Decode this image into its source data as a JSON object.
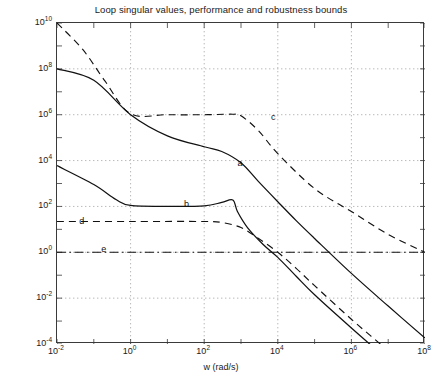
{
  "chart_data": {
    "type": "line",
    "title": "Loop singular values, performance and robustness bounds",
    "xlabel": "w (rad/s)",
    "ylabel": "",
    "xscale": "log",
    "yscale": "log",
    "xlim": [
      0.01,
      100000000
    ],
    "ylim": [
      0.0001,
      10000000000
    ],
    "grid": true,
    "legend": "none",
    "xticks": [
      {
        "value": 0.01,
        "label": "10",
        "exp": "-2"
      },
      {
        "value": 1,
        "label": "10",
        "exp": "0"
      },
      {
        "value": 100,
        "label": "10",
        "exp": "2"
      },
      {
        "value": 10000,
        "label": "10",
        "exp": "4"
      },
      {
        "value": 1000000,
        "label": "10",
        "exp": "6"
      },
      {
        "value": 100000000,
        "label": "10",
        "exp": "8"
      }
    ],
    "yticks": [
      {
        "value": 10000000000,
        "label": "10",
        "exp": "10"
      },
      {
        "value": 100000000,
        "label": "10",
        "exp": "8"
      },
      {
        "value": 1000000,
        "label": "10",
        "exp": "6"
      },
      {
        "value": 10000,
        "label": "10",
        "exp": "4"
      },
      {
        "value": 100,
        "label": "10",
        "exp": "2"
      },
      {
        "value": 1,
        "label": "10",
        "exp": "0"
      },
      {
        "value": 0.01,
        "label": "10",
        "exp": "-2"
      },
      {
        "value": 0.0001,
        "label": "10",
        "exp": "-4"
      }
    ],
    "annotations": [
      {
        "text": "a",
        "x": 1000,
        "y": 7000
      },
      {
        "text": "b",
        "x": 35,
        "y": 120
      },
      {
        "text": "c",
        "x": 8000,
        "y": 700000
      },
      {
        "text": "d",
        "x": 0.05,
        "y": 20
      },
      {
        "text": "e",
        "x": 0.2,
        "y": 1.2
      }
    ],
    "series": [
      {
        "name": "a",
        "role": "loop-singular-value-upper",
        "style": "solid",
        "color": "#111111",
        "points": [
          [
            0.01,
            100000000.0
          ],
          [
            0.1,
            31600000.0
          ],
          [
            1,
            1000000.0
          ],
          [
            10,
            120000.0
          ],
          [
            100,
            40000.0
          ],
          [
            300,
            25000.0
          ],
          [
            1000,
            8000.0
          ],
          [
            3000,
            1200.0
          ],
          [
            10000,
            160.0
          ],
          [
            31600,
            24.0
          ],
          [
            100000,
            4.0
          ],
          [
            1000000,
            0.12
          ],
          [
            10000000,
            0.0045
          ],
          [
            100000000,
            0.00018
          ]
        ]
      },
      {
        "name": "b",
        "role": "loop-singular-value-lower",
        "style": "solid",
        "color": "#111111",
        "points": [
          [
            0.01,
            6000.0
          ],
          [
            0.1,
            900.0
          ],
          [
            0.4,
            200.0
          ],
          [
            1,
            110.0
          ],
          [
            10,
            100.0
          ],
          [
            100,
            105.0
          ],
          [
            300,
            150.0
          ],
          [
            600,
            190.0
          ],
          [
            800,
            60.0
          ],
          [
            1500,
            12.0
          ],
          [
            4000,
            2.2
          ],
          [
            10000,
            0.6
          ],
          [
            31600,
            0.09
          ],
          [
            100000,
            0.014
          ],
          [
            1000000,
            0.0005
          ],
          [
            10000000,
            2e-05
          ],
          [
            100000000,
            9e-07
          ]
        ]
      },
      {
        "name": "c",
        "role": "robustness-bound",
        "style": "dashed",
        "color": "#111111",
        "points": [
          [
            0.01,
            10000000000.0
          ],
          [
            0.05,
            700000000.0
          ],
          [
            0.2,
            30000000.0
          ],
          [
            1,
            1100000.0
          ],
          [
            10,
            1000000.0
          ],
          [
            100,
            1000000.0
          ],
          [
            600,
            1050000.0
          ],
          [
            1000,
            900000.0
          ],
          [
            3000,
            200000.0
          ],
          [
            10000,
            20000.0
          ],
          [
            100000,
            600.0
          ],
          [
            1000000,
            60.0
          ],
          [
            10000000,
            6.0
          ],
          [
            100000000,
            1.0
          ]
        ]
      },
      {
        "name": "d",
        "role": "performance-bound",
        "style": "dashed",
        "color": "#111111",
        "points": [
          [
            0.01,
            22.0
          ],
          [
            1,
            22.0
          ],
          [
            100,
            22.0
          ],
          [
            300,
            20.0
          ],
          [
            1000,
            12.0
          ],
          [
            3000,
            4.0
          ],
          [
            10000,
            1.0
          ],
          [
            31600,
            0.2
          ],
          [
            100000,
            0.035
          ],
          [
            1000000,
            0.0012
          ],
          [
            10000000,
            5e-05
          ],
          [
            100000000,
            1.8e-06
          ]
        ]
      },
      {
        "name": "e",
        "role": "unity-gain-crossover-line",
        "style": "dashdot",
        "color": "#111111",
        "points": [
          [
            0.01,
            1.0
          ],
          [
            100000000,
            1.0
          ]
        ]
      }
    ]
  }
}
